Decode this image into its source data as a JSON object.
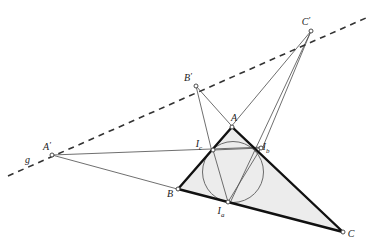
{
  "figure": {
    "background_color": "#ffffff",
    "line_color": "#555555",
    "bold_line_color": "#111111",
    "dashed_line_color": "#333333",
    "fill_color": "#ececec",
    "circle_stroke": "#6a6a6a",
    "point_stroke": "#3a3a3a",
    "point_fill": "#ffffff"
  },
  "points": [
    {
      "id": "A",
      "label": "A",
      "sub": "",
      "x": 232,
      "y": 127,
      "label_x": 234,
      "label_y": 121,
      "marker": true
    },
    {
      "id": "B",
      "label": "B",
      "sub": "",
      "x": 178,
      "y": 189,
      "label_x": 170,
      "label_y": 197,
      "marker": true
    },
    {
      "id": "C",
      "label": "C",
      "sub": "",
      "x": 343,
      "y": 232,
      "label_x": 351,
      "label_y": 237,
      "marker": true
    },
    {
      "id": "Ia",
      "label": "I",
      "sub": "a",
      "x": 228,
      "y": 202,
      "label_x": 221,
      "label_y": 214,
      "marker": true
    },
    {
      "id": "Ib",
      "label": "I",
      "sub": "b",
      "x": 261,
      "y": 148,
      "label_x": 266,
      "label_y": 150,
      "marker": true
    },
    {
      "id": "Ic",
      "label": "I",
      "sub": "c",
      "x": 213,
      "y": 150,
      "label_x": 199,
      "label_y": 147,
      "marker": true
    },
    {
      "id": "Ap",
      "label": "A",
      "sub": "",
      "prime": true,
      "x": 52,
      "y": 155,
      "label_x": 47,
      "label_y": 150,
      "marker": true
    },
    {
      "id": "Bp",
      "label": "B",
      "sub": "",
      "prime": true,
      "x": 196,
      "y": 86,
      "label_x": 188,
      "label_y": 81,
      "marker": true
    },
    {
      "id": "Cp",
      "label": "C",
      "sub": "",
      "prime": true,
      "x": 311,
      "y": 31,
      "label_x": 306,
      "label_y": 25,
      "marker": true
    }
  ],
  "axis_label": {
    "text": "g",
    "x": 25,
    "y": 163
  },
  "triangle": {
    "name": "main-triangle-ABC",
    "vertices": [
      "A",
      "B",
      "C"
    ],
    "stroke_width": 2.4,
    "filled": true
  },
  "contact_triangle": {
    "name": "contact-triangle",
    "vertices": [
      "Ia",
      "Ib",
      "Ic"
    ],
    "stroke_width": 1.0
  },
  "incircle": {
    "name": "incircle",
    "cx": 233,
    "cy": 172,
    "r": 30.5,
    "stroke_width": 1.0
  },
  "perspective_axis": {
    "name": "perspective-axis-g",
    "from_x": 8,
    "from_y": 176,
    "to_x": 366,
    "to_y": 18,
    "dash": "6 5",
    "stroke_width": 1.6
  },
  "thin_lines": [
    {
      "name": "line-Ap-to-Ib",
      "x1": 52,
      "y1": 155,
      "x2": 265,
      "y2": 147
    },
    {
      "name": "line-Ap-to-B",
      "x1": 52,
      "y1": 155,
      "x2": 181,
      "y2": 190
    },
    {
      "name": "line-Bp-to-A",
      "x1": 196,
      "y1": 86,
      "x2": 238,
      "y2": 133
    },
    {
      "name": "line-Bp-to-Ic",
      "x1": 196,
      "y1": 86,
      "x2": 212,
      "y2": 152
    },
    {
      "name": "line-Cp-to-A",
      "x1": 311,
      "y1": 31,
      "x2": 230,
      "y2": 128
    },
    {
      "name": "line-Cp-to-Ib",
      "x1": 311,
      "y1": 31,
      "x2": 262,
      "y2": 149
    },
    {
      "name": "line-Cp-to-Ia",
      "x1": 311,
      "y1": 31,
      "x2": 230,
      "y2": 203
    },
    {
      "name": "line-Ia-to-Ic",
      "x1": 228,
      "y1": 202,
      "x2": 213,
      "y2": 150
    },
    {
      "name": "line-Ia-to-Ib",
      "x1": 228,
      "y1": 202,
      "x2": 261,
      "y2": 148
    },
    {
      "name": "line-Ic-to-Ib",
      "x1": 213,
      "y1": 150,
      "x2": 261,
      "y2": 148
    }
  ]
}
